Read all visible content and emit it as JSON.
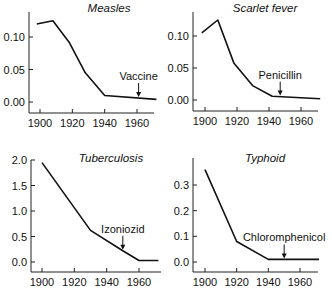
{
  "chart_data": [
    {
      "type": "line",
      "title": "Measles",
      "xlabel": "",
      "ylabel": "",
      "xlim": [
        1897,
        1973
      ],
      "ylim": [
        -0.017,
        0.14
      ],
      "xticks": [
        1900,
        1920,
        1940,
        1960
      ],
      "yticks": [
        0.0,
        0.05,
        0.1
      ],
      "ytick_labels": [
        "0.00",
        "0.05",
        "0.10"
      ],
      "x": [
        1898,
        1908,
        1918,
        1928,
        1940,
        1972
      ],
      "values": [
        0.12,
        0.125,
        0.092,
        0.045,
        0.01,
        0.004
      ],
      "annotation": {
        "text": "Vaccine",
        "x": 1961
      },
      "frame": {
        "x0": 29,
        "y0": 12,
        "w": 125,
        "h": 101,
        "xpx_1900": 40,
        "xpx_1960": 137,
        "ypx_top": 37,
        "ypx_bottom": 102
      }
    },
    {
      "type": "line",
      "title": "Scarlet fever",
      "xlabel": "",
      "ylabel": "",
      "xlim": [
        1897,
        1973
      ],
      "ylim": [
        -0.017,
        0.14
      ],
      "xticks": [
        1900,
        1920,
        1940,
        1960
      ],
      "yticks": [
        0.0,
        0.05,
        0.1
      ],
      "ytick_labels": [
        "0.00",
        "0.05",
        "0.10"
      ],
      "x": [
        1898,
        1908,
        1918,
        1930,
        1942,
        1972
      ],
      "values": [
        0.105,
        0.125,
        0.058,
        0.022,
        0.006,
        0.002
      ],
      "annotation": {
        "text": "Penicillin",
        "x": 1947
      },
      "frame": {
        "x0": 193,
        "y0": 12,
        "w": 125,
        "h": 99,
        "xpx_1900": 205,
        "xpx_1960": 301,
        "ypx_top": 36,
        "ypx_bottom": 100
      }
    },
    {
      "type": "line",
      "title": "Tuberculosis",
      "xlabel": "",
      "ylabel": "",
      "xlim": [
        1897,
        1973
      ],
      "ylim": [
        -0.2,
        2.0
      ],
      "xticks": [
        1900,
        1920,
        1940,
        1960
      ],
      "yticks": [
        0.0,
        0.5,
        1.0,
        1.5,
        2.0
      ],
      "ytick_labels": [
        "0.0",
        "0.5",
        "1.0",
        "1.5",
        "2.0"
      ],
      "x": [
        1900,
        1930,
        1950,
        1960,
        1972
      ],
      "values": [
        1.95,
        0.62,
        0.22,
        0.03,
        0.03
      ],
      "annotation": {
        "text": "Izoniozid",
        "x": 1950
      },
      "frame": {
        "x0": 31,
        "y0": 160,
        "w": 130,
        "h": 112,
        "xpx_1900": 42,
        "xpx_1960": 139,
        "ypx_top": 160,
        "ypx_bottom": 262,
        "ytop_val": 2.0
      }
    },
    {
      "type": "line",
      "title": "Typhoid",
      "xlabel": "",
      "ylabel": "",
      "xlim": [
        1897,
        1973
      ],
      "ylim": [
        -0.04,
        0.38
      ],
      "xticks": [
        1900,
        1920,
        1940,
        1960
      ],
      "yticks": [
        0.0,
        0.1,
        0.2,
        0.3
      ],
      "ytick_labels": [
        "0.0",
        "0.1",
        "0.2",
        "0.3"
      ],
      "x": [
        1900,
        1920,
        1940,
        1972
      ],
      "values": [
        0.36,
        0.08,
        0.01,
        0.01
      ],
      "annotation": {
        "text": "Chloromphenicol",
        "x": 1950
      },
      "frame": {
        "x0": 193,
        "y0": 158,
        "w": 125,
        "h": 114,
        "xpx_1900": 205,
        "xpx_1960": 300,
        "ypx_top": 185,
        "ypx_bottom": 262,
        "ytop_val": 0.3
      }
    }
  ]
}
